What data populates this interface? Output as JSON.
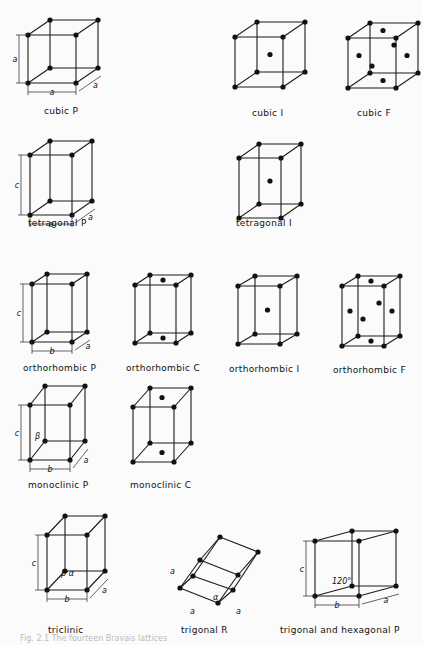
{
  "figure": {
    "lattices": [
      {
        "label": "cubic P"
      },
      {
        "label": "cubic I"
      },
      {
        "label": "cubic F"
      },
      {
        "label": "tetragonal P"
      },
      {
        "label": "tetragonal I"
      },
      {
        "label": "orthorhombic P"
      },
      {
        "label": "orthorhombic C"
      },
      {
        "label": "orthorhombic I"
      },
      {
        "label": "orthorhombic F"
      },
      {
        "label": "monoclinic P"
      },
      {
        "label": "monoclinic C"
      },
      {
        "label": "triclinic"
      },
      {
        "label": "trigonal R"
      },
      {
        "label": "trigonal and hexagonal P"
      }
    ],
    "dimension_labels": {
      "a": "a",
      "b": "b",
      "c": "c",
      "alpha": "α",
      "beta": "β",
      "gamma": "γ",
      "angle_120": "120°"
    },
    "caption": "Fig. 2.1  The fourteen Bravais lattices"
  }
}
